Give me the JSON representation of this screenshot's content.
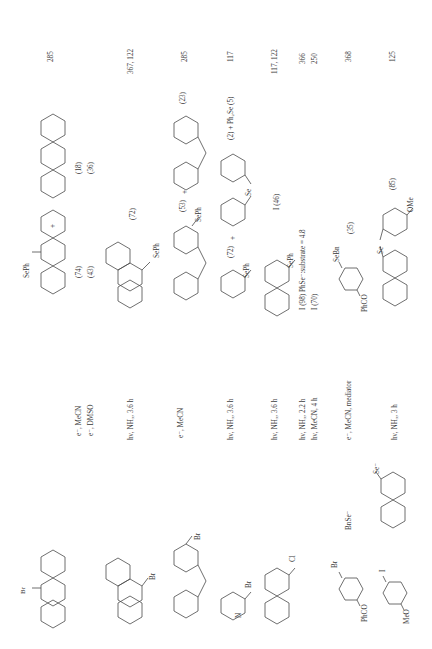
{
  "table": {
    "columns": [
      "Substrate",
      "Nucleophile",
      "Conditions",
      "Products (yield %)",
      "Ref."
    ],
    "rows": [
      {
        "substrate": "9-bromoanthracene",
        "substrate_label": "Br",
        "nucleophile": "",
        "conditions": [
          "e⁻, MeCN",
          "e⁻, DMSO"
        ],
        "products_label": "SePh",
        "yields_a": [
          "(74)",
          "(43)"
        ],
        "plus": "+",
        "yields_b": [
          "(18)",
          "(36)"
        ],
        "ref": "285"
      },
      {
        "substrate": "9-bromophenanthrene",
        "substrate_label": "Br",
        "nucleophile": "",
        "conditions": [
          "hν, NH₃, 3.6 h"
        ],
        "products_label": "SePh",
        "yields_a": [
          "(72)"
        ],
        "ref": "367, 122"
      },
      {
        "substrate": "2-bromofluorene",
        "substrate_label": "Br",
        "nucleophile": "",
        "conditions": [
          "e⁻, MeCN"
        ],
        "products_label": "SePh",
        "yields_a": [
          "(53)"
        ],
        "plus": "+",
        "yields_b": [
          "(23)"
        ],
        "ref": "285"
      },
      {
        "substrate": "2-bromopyridine",
        "substrate_label": "Br",
        "substrate_n": "N",
        "nucleophile": "",
        "conditions": [
          "hν, NH₃, 3.6 h"
        ],
        "products_label": "SePh",
        "yields_a": [
          "(72)"
        ],
        "plus": "+",
        "se_label": "Se",
        "yields_b": [
          "(2) + Ph₂Se (5)"
        ],
        "ref": "117"
      },
      {
        "substrate": "2-chloroquinoline",
        "substrate_label": "Cl",
        "substrate_n": "N",
        "nucleophile": "",
        "conditions": [
          "hν, NH₃, 3.6 h"
        ],
        "products_label": "SePh",
        "yields_a": [
          "I (46)"
        ],
        "ref": "117, 122"
      },
      {
        "substrate": "",
        "nucleophile": "",
        "conditions": [
          "hν, NH₃, 2.2 h",
          "hν, MeCN, 4 h"
        ],
        "products_text": [
          "I (98) PhSe⁻:substrate = 4.8",
          "I (70)"
        ],
        "ref_lines": [
          "366",
          "250"
        ]
      },
      {
        "substrate": "4-bromobenzophenone",
        "substrate_label": "Br",
        "substrate_sub": "PhCO",
        "nucleophile": "BnSe⁻",
        "conditions": [
          "e⁻, MeCN, mediator"
        ],
        "products_label": "SeBn",
        "products_sub": "PhCO",
        "yields_a": [
          "(35)"
        ],
        "ref": "368"
      },
      {
        "substrate": "4-iodoanisole",
        "substrate_label": "I",
        "substrate_sub": "MeO",
        "nucleophile": "2-naphthylselenide",
        "nucleophile_label": "Se⁻",
        "conditions": [
          "hν, NH₃, 3 h"
        ],
        "products_label": "Se",
        "products_sub": "OMe",
        "yields_a": [
          "(85)"
        ],
        "ref": "125"
      }
    ]
  }
}
